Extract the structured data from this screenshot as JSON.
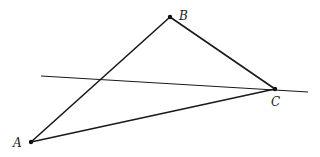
{
  "diagram": {
    "type": "geometry",
    "points": [
      {
        "id": "A",
        "label": "A",
        "x": 31,
        "y": 142,
        "label_x": 13,
        "label_y": 147
      },
      {
        "id": "B",
        "label": "B",
        "x": 170,
        "y": 17,
        "label_x": 179,
        "label_y": 20
      },
      {
        "id": "C",
        "label": "C",
        "x": 275,
        "y": 89,
        "label_x": 271,
        "label_y": 106
      }
    ],
    "segments": [
      {
        "from": "A",
        "to": "B"
      },
      {
        "from": "B",
        "to": "C"
      },
      {
        "from": "A",
        "to": "C"
      }
    ],
    "line": {
      "through": "C",
      "x1": 41,
      "y1": 76,
      "x2": 308,
      "y2": 92
    },
    "colors": {
      "stroke": "#1a1a1a",
      "background": "#ffffff"
    }
  }
}
